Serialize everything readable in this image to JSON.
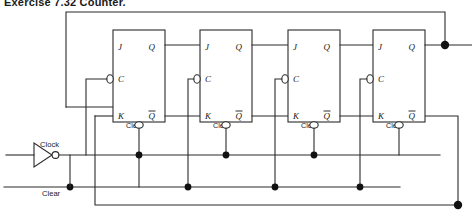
{
  "figure": {
    "title": "Exercise 7.32 Counter.",
    "type": "logic-circuit-schematic"
  },
  "signals": {
    "clock_label": "Clock",
    "clear_label": "Clear"
  },
  "flipflops": [
    {
      "id": "ff1",
      "j": "J",
      "k": "K",
      "c": "C",
      "q": "Q",
      "qbar": "Q",
      "clear": "Clear"
    },
    {
      "id": "ff2",
      "j": "J",
      "k": "K",
      "c": "C",
      "q": "Q",
      "qbar": "Q",
      "clear": "Clear"
    },
    {
      "id": "ff3",
      "j": "J",
      "k": "K",
      "c": "C",
      "q": "Q",
      "qbar": "Q",
      "clear": "Clear"
    },
    {
      "id": "ff4",
      "j": "J",
      "k": "K",
      "c": "C",
      "q": "Q",
      "qbar": "Q",
      "clear": "Clear"
    }
  ],
  "icons": {
    "inverter": "inverter-gate-icon",
    "inversion_bubble": "inversion-bubble-icon",
    "junction": "junction-dot-icon"
  },
  "colors": {
    "wire": "#2b2b2b",
    "junction": "#111111",
    "text": "#1a1a1a",
    "background": "#ffffff"
  }
}
